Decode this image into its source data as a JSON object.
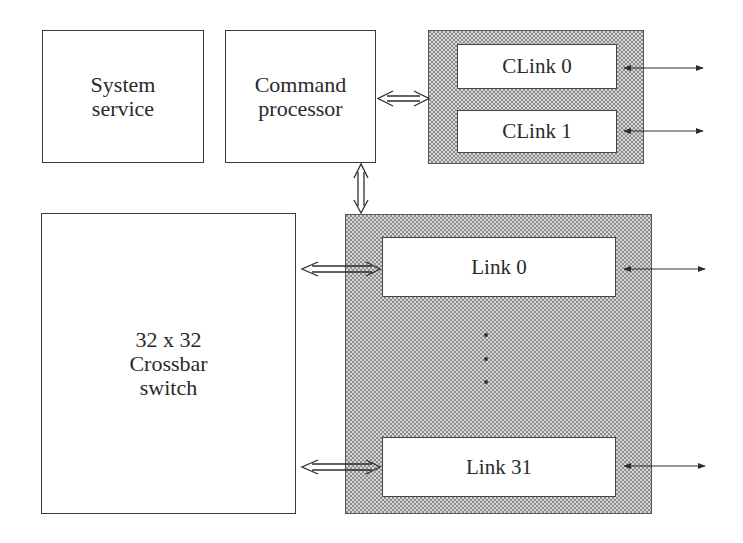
{
  "diagram": {
    "blocks": {
      "system_service": {
        "label": "System\nservice"
      },
      "command_processor": {
        "label": "Command\nprocessor"
      },
      "crossbar": {
        "label": "32 x 32\nCrossbar\nswitch"
      }
    },
    "clink_group": {
      "items": [
        {
          "label": "CLink 0"
        },
        {
          "label": "CLink 1"
        }
      ]
    },
    "link_group": {
      "items": [
        {
          "label": "Link 0"
        },
        {
          "label": "Link 31"
        }
      ],
      "ellipsis": "⋮"
    },
    "colors": {
      "stroke": "#3a3a3a",
      "shade_dark": "#8c8c8c",
      "shade_light": "#d8d8d8",
      "background": "#ffffff"
    },
    "connections": [
      {
        "from": "Command processor",
        "to": "CLink group",
        "type": "bidirectional-double"
      },
      {
        "from": "Command processor",
        "to": "Link group",
        "type": "bidirectional-double"
      },
      {
        "from": "Crossbar switch",
        "to": "Link 0",
        "type": "bidirectional-double"
      },
      {
        "from": "Crossbar switch",
        "to": "Link 31",
        "type": "bidirectional-double"
      },
      {
        "from": "CLink 0",
        "to": "external",
        "type": "bidirectional"
      },
      {
        "from": "CLink 1",
        "to": "external",
        "type": "bidirectional"
      },
      {
        "from": "Link 0",
        "to": "external",
        "type": "bidirectional"
      },
      {
        "from": "Link 31",
        "to": "external",
        "type": "bidirectional"
      }
    ]
  }
}
